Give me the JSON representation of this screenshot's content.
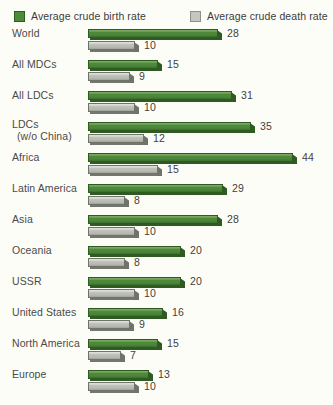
{
  "legend": {
    "birth": {
      "label": "Average crude birth rate",
      "swatch": "green-swatch-icon",
      "color": "#4e8a3c"
    },
    "death": {
      "label": "Average crude death rate",
      "swatch": "gray-swatch-icon",
      "color": "#c3c7bd"
    }
  },
  "chart_data": {
    "type": "bar",
    "orientation": "horizontal",
    "title": "",
    "subtitle": "",
    "xlabel": "",
    "ylabel": "",
    "xlim": [
      0,
      44
    ],
    "grid": false,
    "legend_position": "top",
    "units": "per 1,000 population",
    "categories": [
      "World",
      "All MDCs",
      "All LDCs",
      "LDCs (w/o China)",
      "Africa",
      "Latin America",
      "Asia",
      "Oceania",
      "USSR",
      "United States",
      "North America",
      "Europe"
    ],
    "series": [
      {
        "name": "Average crude birth rate",
        "color": "#4e8a3c",
        "values": [
          28,
          15,
          31,
          35,
          44,
          29,
          28,
          20,
          20,
          16,
          15,
          13
        ]
      },
      {
        "name": "Average crude death rate",
        "color": "#c3c7bd",
        "values": [
          10,
          9,
          10,
          12,
          15,
          8,
          10,
          8,
          10,
          9,
          7,
          10
        ]
      }
    ]
  },
  "rows": [
    {
      "label": "World",
      "label2": "",
      "birth": 28,
      "death": 10
    },
    {
      "label": "All MDCs",
      "label2": "",
      "birth": 15,
      "death": 9
    },
    {
      "label": "All LDCs",
      "label2": "",
      "birth": 31,
      "death": 10
    },
    {
      "label": "LDCs",
      "label2": "(w/o China)",
      "birth": 35,
      "death": 12
    },
    {
      "label": "Africa",
      "label2": "",
      "birth": 44,
      "death": 15
    },
    {
      "label": "Latin America",
      "label2": "",
      "birth": 29,
      "death": 8
    },
    {
      "label": "Asia",
      "label2": "",
      "birth": 28,
      "death": 10
    },
    {
      "label": "Oceania",
      "label2": "",
      "birth": 20,
      "death": 8
    },
    {
      "label": "USSR",
      "label2": "",
      "birth": 20,
      "death": 10
    },
    {
      "label": "United States",
      "label2": "",
      "birth": 16,
      "death": 9
    },
    {
      "label": "North America",
      "label2": "",
      "birth": 15,
      "death": 7
    },
    {
      "label": "Europe",
      "label2": "",
      "birth": 13,
      "death": 10
    }
  ]
}
